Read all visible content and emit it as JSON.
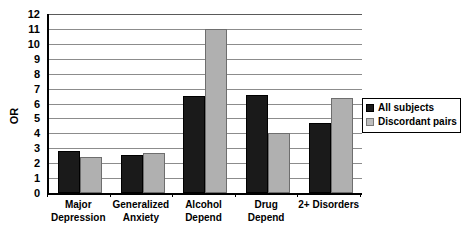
{
  "chart_data": {
    "type": "bar",
    "title": "",
    "xlabel": "",
    "ylabel": "OR",
    "ylim": [
      0,
      12
    ],
    "ytick_step": 1,
    "yticks": [
      12,
      11,
      10,
      9,
      8,
      7,
      6,
      5,
      4,
      3,
      2,
      1,
      0
    ],
    "grid": true,
    "legend_position": "right",
    "categories": [
      "Major Depression",
      "Generalized Anxiety",
      "Alcohol Depend",
      "Drug Depend",
      "2+ Disorders"
    ],
    "category_lines": [
      [
        "Major",
        "Depression"
      ],
      [
        "Generalized",
        "Anxiety"
      ],
      [
        "Alcohol",
        "Depend"
      ],
      [
        "Drug",
        "Depend"
      ],
      [
        "2+ Disorders",
        ""
      ]
    ],
    "series": [
      {
        "name": "All subjects",
        "color": "#1a1a1a",
        "values": [
          2.8,
          2.55,
          6.5,
          6.6,
          4.7
        ]
      },
      {
        "name": "Discordant pairs",
        "color": "#b0b0b0",
        "values": [
          2.4,
          2.7,
          11.0,
          4.0,
          6.4
        ]
      }
    ]
  },
  "legend": {
    "items": [
      {
        "label": "All subjects",
        "swatch": "black-square-icon"
      },
      {
        "label": "Discordant pairs",
        "swatch": "gray-square-icon"
      }
    ]
  }
}
